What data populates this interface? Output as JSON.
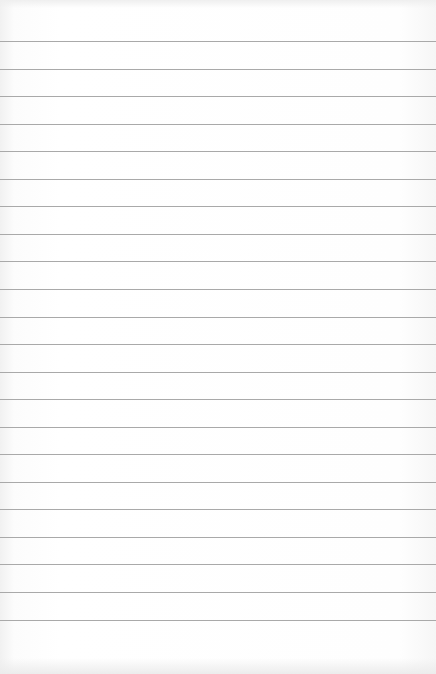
{
  "paper": {
    "type": "lined notebook paper",
    "background_color": "#ffffff",
    "rule_color": "#a9a9a9",
    "rule_count": 22,
    "first_rule_y": 41,
    "rule_spacing_px": 27.55
  }
}
